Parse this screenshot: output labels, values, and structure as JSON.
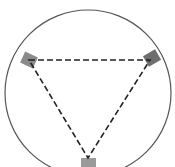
{
  "diagram": {
    "type": "circle-inscribed-triangle",
    "circle": {
      "cx": 88,
      "cy": 93,
      "r": 83,
      "stroke": "#555555"
    },
    "triangle": {
      "vertices": [
        {
          "name": "left",
          "x": 29,
          "y": 60
        },
        {
          "name": "right",
          "x": 150,
          "y": 60
        },
        {
          "name": "bottom",
          "x": 88,
          "y": 158
        }
      ],
      "stroke": "#222222",
      "dash": "6,3"
    },
    "markers": [
      {
        "name": "left",
        "x": 22,
        "y": 54,
        "w": 14,
        "h": 12,
        "rotate": 25,
        "fill": "#8a8a8a"
      },
      {
        "name": "right",
        "x": 145,
        "y": 52,
        "w": 14,
        "h": 12,
        "rotate": -30,
        "fill": "#6e6e6e"
      },
      {
        "name": "bottom",
        "x": 81,
        "y": 158,
        "w": 15,
        "h": 10,
        "rotate": 0,
        "fill": "#9a9a9a"
      }
    ]
  }
}
